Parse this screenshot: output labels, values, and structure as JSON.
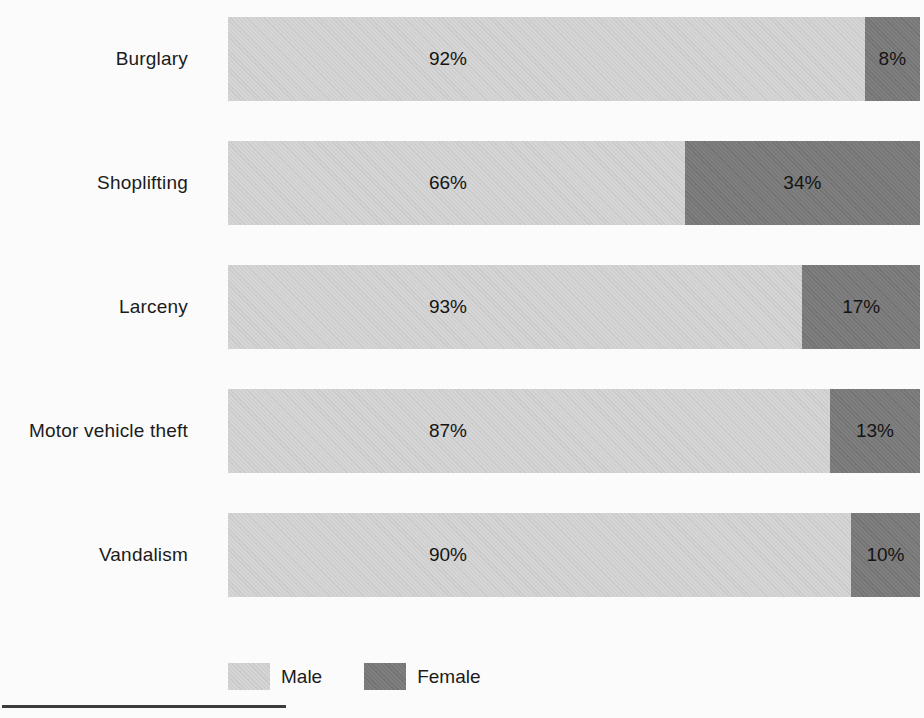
{
  "chart_data": {
    "type": "bar",
    "orientation": "horizontal",
    "stacked": true,
    "unit": "percent",
    "categories": [
      "Burglary",
      "Shoplifting",
      "Larceny",
      "Motor vehicle theft",
      "Vandalism"
    ],
    "series": [
      {
        "name": "Male",
        "values": [
          92,
          66,
          93,
          87,
          90
        ],
        "color": "#d3d3d3"
      },
      {
        "name": "Female",
        "values": [
          8,
          34,
          17,
          13,
          10
        ],
        "color": "#787878"
      }
    ],
    "data_labels": {
      "male": [
        "92%",
        "66%",
        "93%",
        "87%",
        "90%"
      ],
      "female": [
        "8%",
        "34%",
        "17%",
        "13%",
        "10%"
      ]
    },
    "title": "",
    "xlabel": "",
    "ylabel": "",
    "xlim": [
      0,
      100
    ],
    "grid": false,
    "legend_position": "bottom"
  },
  "rows": [
    {
      "category": "Burglary",
      "male_label": "92%",
      "female_label": "8%",
      "female_pct": 8
    },
    {
      "category": "Shoplifting",
      "male_label": "66%",
      "female_label": "34%",
      "female_pct": 34
    },
    {
      "category": "Larceny",
      "male_label": "93%",
      "female_label": "17%",
      "female_pct": 17
    },
    {
      "category": "Motor vehicle theft",
      "male_label": "87%",
      "female_label": "13%",
      "female_pct": 13
    },
    {
      "category": "Vandalism",
      "male_label": "90%",
      "female_label": "10%",
      "female_pct": 10
    }
  ],
  "legend": {
    "male_label": "Male",
    "female_label": "Female"
  },
  "colors": {
    "male": "#d3d3d3",
    "female": "#787878",
    "text": "#1b1b1b",
    "background": "#fbfbfb"
  }
}
